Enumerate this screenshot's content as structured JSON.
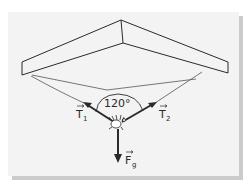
{
  "figure": {
    "angle_label": "120°",
    "vectors": [
      {
        "name": "T",
        "subscript": "1",
        "meaning": "tension in left thread"
      },
      {
        "name": "T",
        "subscript": "2",
        "meaning": "tension in right thread"
      },
      {
        "name": "F",
        "subscript": "g",
        "meaning": "gravitational force"
      }
    ],
    "colors": {
      "card": "#f3f3f3",
      "shadow": "#c9c9c9",
      "ink": "#2a2a2a",
      "thread": "#555555"
    }
  }
}
